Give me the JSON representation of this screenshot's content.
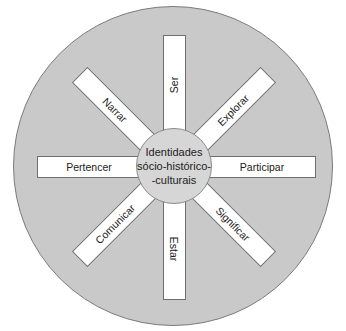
{
  "diagram": {
    "center_label_lines": [
      "Identidades",
      "sócio-histórico-",
      "-culturais"
    ],
    "spokes": [
      {
        "id": "ser",
        "label": "Ser",
        "direction": "up"
      },
      {
        "id": "explorar",
        "label": "Explorar",
        "direction": "up-right"
      },
      {
        "id": "participar",
        "label": "Participar",
        "direction": "right"
      },
      {
        "id": "significar",
        "label": "Significar",
        "direction": "down-right"
      },
      {
        "id": "estar",
        "label": "Estar",
        "direction": "down"
      },
      {
        "id": "comunicar",
        "label": "Comunicar",
        "direction": "down-left"
      },
      {
        "id": "pertencer",
        "label": "Pertencer",
        "direction": "left"
      },
      {
        "id": "narrar",
        "label": "Narrar",
        "direction": "up-left"
      }
    ],
    "colors": {
      "outer_circle": "#c9c9c9",
      "hub": "#d6d6d6",
      "bar": "#ffffff",
      "stroke": "#6e6e6e"
    }
  }
}
